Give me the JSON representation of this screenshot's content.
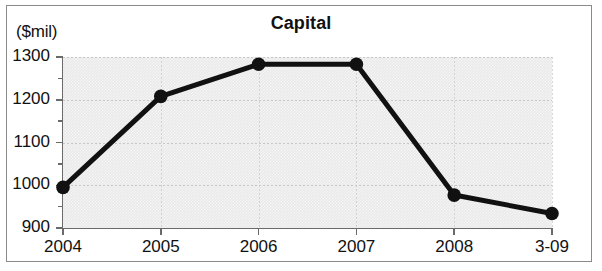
{
  "chart_data": {
    "type": "line",
    "title": "Capital",
    "xlabel": "",
    "ylabel": "($mil)",
    "unit_caption": "($mil)",
    "categories": [
      "2004",
      "2005",
      "2006",
      "2007",
      "2008",
      "3-09"
    ],
    "values": [
      995,
      1208,
      1283,
      1283,
      977,
      934
    ],
    "series": [
      {
        "name": "Capital",
        "values": [
          995,
          1208,
          1283,
          1283,
          977,
          934
        ]
      }
    ],
    "ylim": [
      900,
      1300
    ],
    "ytick_labels": [
      "900",
      "1000",
      "1100",
      "1200",
      "1300"
    ],
    "ytick_values": [
      900,
      1000,
      1100,
      1200,
      1300
    ],
    "yminor_values": [
      950,
      1050,
      1150,
      1250
    ],
    "grid": true,
    "legend": "none",
    "marker": "filled-circle",
    "colors": {
      "line": "#111111",
      "marker": "#111111",
      "plot_background": "#e9e9e9",
      "gridline": "#c3c3c3",
      "axis": "#6a6a6a",
      "text": "#111111",
      "frame": "#8a8a8a",
      "page_background": "#ffffff"
    }
  }
}
